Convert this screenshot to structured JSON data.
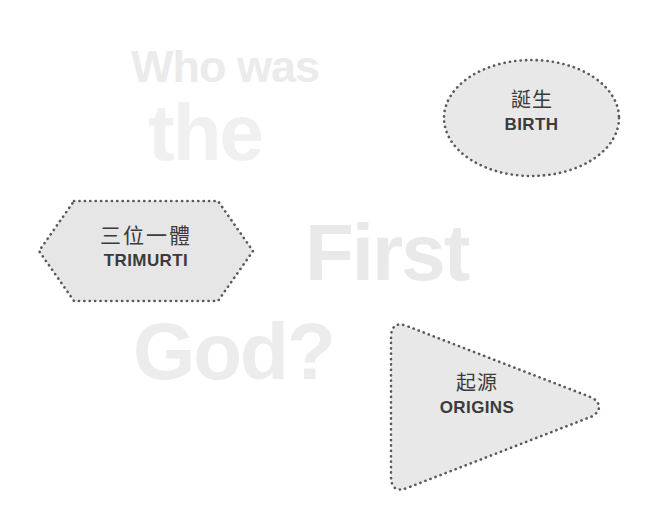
{
  "canvas": {
    "width": 664,
    "height": 520,
    "background_color": "#ffffff"
  },
  "background_headline": {
    "full_text": "Who was the First God?",
    "color_light": "#f0f0f0",
    "lines": [
      {
        "text": "Who was",
        "color": "#ebebeb"
      },
      {
        "text": "the",
        "color": "#f0f0f0"
      },
      {
        "text": "First",
        "color": "#e9e9e9"
      },
      {
        "text": "God?",
        "color": "#ececec"
      }
    ]
  },
  "shapes": [
    {
      "id": "trimurti",
      "form": "hexagon",
      "cjk": "三位一體",
      "roman": "TRIMURTI",
      "fill": "#e6e6e6",
      "border_style": "dotted",
      "border_color": "#5a5a5a",
      "text_color": "#3b3b3b"
    },
    {
      "id": "birth",
      "form": "ellipse",
      "cjk": "誕生",
      "roman": "BIRTH",
      "fill": "#e8e8e8",
      "border_style": "dotted",
      "border_color": "#5a5a5a",
      "text_color": "#3b3b3b"
    },
    {
      "id": "origins",
      "form": "triangle-right",
      "cjk": "起源",
      "roman": "ORIGINS",
      "fill": "#e8e8e8",
      "border_style": "dotted",
      "border_color": "#5a5a5a",
      "text_color": "#3b3b3b"
    }
  ]
}
